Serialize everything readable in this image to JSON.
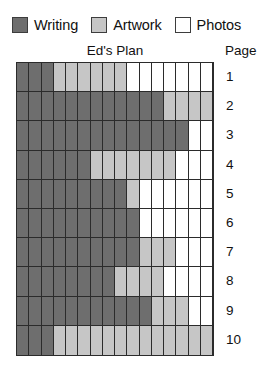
{
  "legend": {
    "entries": [
      {
        "label": "Writing",
        "key": "writing",
        "color": "#6e6e6e",
        "swatch": "legend-swatch-writing"
      },
      {
        "label": "Artwork",
        "key": "artwork",
        "color": "#c6c6c6",
        "swatch": "legend-swatch-artwork"
      },
      {
        "label": "Photos",
        "key": "photos",
        "color": "#ffffff",
        "swatch": "legend-swatch-photos"
      }
    ]
  },
  "chart_title": "Ed's Plan",
  "page_axis_title": "Page",
  "page_labels": [
    "1",
    "2",
    "3",
    "4",
    "5",
    "6",
    "7",
    "8",
    "9",
    "10"
  ],
  "chart_data": {
    "type": "bar",
    "title": "Ed's Plan",
    "xlabel": "",
    "ylabel": "Page",
    "orientation": "horizontal",
    "stacked": true,
    "grid": true,
    "legend_position": "top-left",
    "columns_per_row": 16,
    "xlim": [
      0,
      16
    ],
    "categories": [
      "1",
      "2",
      "3",
      "4",
      "5",
      "6",
      "7",
      "8",
      "9",
      "10"
    ],
    "series": [
      {
        "name": "Writing",
        "color": "#6e6e6e",
        "values": [
          3,
          12,
          14,
          6,
          9,
          10,
          10,
          8,
          11,
          3
        ]
      },
      {
        "name": "Artwork",
        "color": "#c6c6c6",
        "values": [
          6,
          4,
          0,
          7,
          1,
          0,
          3,
          4,
          3,
          13
        ]
      },
      {
        "name": "Photos",
        "color": "#ffffff",
        "values": [
          7,
          0,
          2,
          3,
          6,
          6,
          3,
          4,
          2,
          0
        ]
      }
    ],
    "rows": [
      {
        "page": "1",
        "writing": 3,
        "artwork": 6,
        "photos": 7
      },
      {
        "page": "2",
        "writing": 12,
        "artwork": 4,
        "photos": 0
      },
      {
        "page": "3",
        "writing": 14,
        "artwork": 0,
        "photos": 2
      },
      {
        "page": "4",
        "writing": 6,
        "artwork": 7,
        "photos": 3
      },
      {
        "page": "5",
        "writing": 9,
        "artwork": 1,
        "photos": 6
      },
      {
        "page": "6",
        "writing": 10,
        "artwork": 0,
        "photos": 6
      },
      {
        "page": "7",
        "writing": 10,
        "artwork": 3,
        "photos": 3
      },
      {
        "page": "8",
        "writing": 8,
        "artwork": 4,
        "photos": 4
      },
      {
        "page": "9",
        "writing": 11,
        "artwork": 3,
        "photos": 2
      },
      {
        "page": "10",
        "writing": 3,
        "artwork": 13,
        "photos": 0
      }
    ]
  }
}
